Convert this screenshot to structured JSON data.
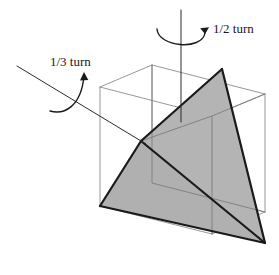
{
  "figure": {
    "background_color": "#ffffff",
    "labels": [
      {
        "id": "half-turn",
        "text": "1/2 turn",
        "x": 213,
        "y": 33,
        "axis": "vertical"
      },
      {
        "id": "third-turn",
        "text": "1/3 turn",
        "x": 50,
        "y": 66,
        "axis": "diagonal"
      }
    ],
    "colors": {
      "tetrahedron_fill": "#b4b4b4",
      "tetrahedron_edge": "#1a1a1a",
      "cube_edge": "#8c8c8c",
      "axis_line": "#2a2a2a",
      "arrow": "#1a1a1a",
      "text": "#1a1a1a"
    },
    "cube": {
      "name": "wireframe-cube",
      "stroke_width": 0.9,
      "vertices": {
        "front_top_left": [
          100,
          87
        ],
        "front_top_right": [
          212,
          116
        ],
        "front_bottom_right": [
          212,
          234
        ],
        "front_bottom_left": [
          100,
          206
        ],
        "back_top_left": [
          152,
          65
        ],
        "back_top_right": [
          265,
          94
        ],
        "back_bottom_right": [
          265,
          212
        ],
        "back_bottom_left": [
          152,
          183
        ]
      },
      "visible_edge_count": 12
    },
    "tetrahedron": {
      "name": "inscribed-tetrahedron",
      "stroke_width": 2.2,
      "vertices": {
        "apex_top": [
          222,
          69
        ],
        "front_left": [
          141,
          141
        ],
        "bottom_left": [
          100,
          206
        ],
        "bottom_right": [
          265,
          243
        ]
      },
      "faces": [
        {
          "name": "upper-right-face",
          "points": "222,69 141,141 265,243"
        },
        {
          "name": "left-face",
          "points": "141,141 100,206 265,243"
        }
      ],
      "edges": [
        {
          "name": "apex-to-front",
          "from": "apex_top",
          "to": "front_left"
        },
        {
          "name": "apex-to-bottom-right",
          "from": "apex_top",
          "to": "bottom_right"
        },
        {
          "name": "front-to-bottom-left",
          "from": "front_left",
          "to": "bottom_left"
        },
        {
          "name": "front-to-bottom-right",
          "from": "front_left",
          "to": "bottom_right"
        },
        {
          "name": "bottom-left-to-bottom-right",
          "from": "bottom_left",
          "to": "bottom_right"
        },
        {
          "name": "apex-to-bottom-left-hidden",
          "from": "apex_top",
          "to": "bottom_left"
        }
      ]
    },
    "axes": [
      {
        "name": "vertical-rotation-axis",
        "from": [
          181,
          10
        ],
        "to": [
          181,
          122
        ],
        "turn_label": "1/2 turn"
      },
      {
        "name": "diagonal-rotation-axis",
        "from": [
          17,
          66
        ],
        "to": [
          146,
          144
        ],
        "turn_label": "1/3 turn"
      }
    ],
    "arrows": [
      {
        "name": "half-turn-arrow",
        "path": "M 158,30 C 159,46 202,49 205,32",
        "head_at": [
          205,
          32
        ],
        "direction": "counterclockwise-up"
      },
      {
        "name": "third-turn-arrow",
        "path": "M 51,110 C 63,113 80,106 83,74",
        "head_at": [
          83,
          74
        ],
        "direction": "counterclockwise-up"
      }
    ]
  }
}
